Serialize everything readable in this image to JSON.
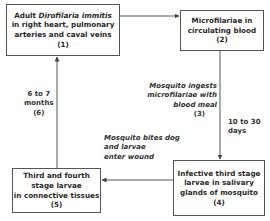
{
  "diagram": {
    "type": "life-cycle flowchart",
    "stages": [
      {
        "id": 1,
        "lines_pre": "Adult ",
        "lines_italic": "Dirofilaria immitis",
        "line2": "in right heart, pulmonary",
        "line3": "arteries and caval veins",
        "number": "(1)"
      },
      {
        "id": 2,
        "line1": "Microfilariae in",
        "line2": "circulating blood",
        "number": "(2)"
      },
      {
        "id": 4,
        "line1": "Infective third stage",
        "line2": "larvae in salivary",
        "line3": "glands of mosquito",
        "number": "(4)"
      },
      {
        "id": 5,
        "line1": "Third and fourth",
        "line2": "stage larvae",
        "line3": "in connective tissues",
        "number": "(5)"
      }
    ],
    "transitions": {
      "step3": {
        "line1": "Mosquito ingests",
        "line2": "microfilariae with",
        "line3": "blood meal",
        "number": "(3)"
      },
      "duration_2_4": {
        "line1": "10 to 30",
        "line2": "days"
      },
      "step6": {
        "line1": "6 to 7",
        "line2": "months",
        "number": "(6)"
      },
      "bite": {
        "line1": "Mosquito bites dog",
        "line2": "and larvae",
        "line3": "enter wound"
      }
    },
    "edges": [
      {
        "from": 1,
        "to": 2
      },
      {
        "from": 2,
        "to": 4
      },
      {
        "from": 4,
        "to": 5
      },
      {
        "from": 5,
        "to": 1
      }
    ],
    "colors": {
      "line": "#555555",
      "text": "#2a2a2a",
      "background": "#ffffff"
    }
  }
}
